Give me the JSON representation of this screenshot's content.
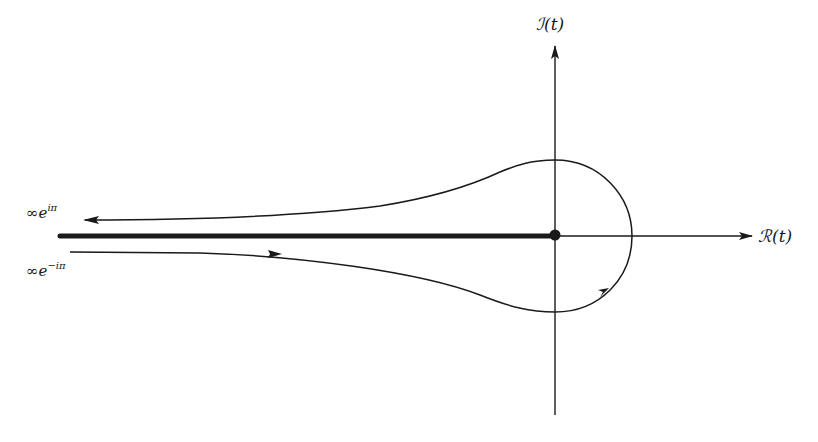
{
  "diagram": {
    "type": "complex-plane contour (Hankel contour)",
    "axes": {
      "vertical_label": "ℐ(t)",
      "horizontal_label": "ℛ(t)"
    },
    "labels": {
      "upper_end": {
        "base": "∞e",
        "exponent": "iπ"
      },
      "lower_end": {
        "base": "∞e",
        "exponent": "−iπ"
      }
    },
    "elements": [
      "vertical imaginary axis with upward arrow",
      "horizontal real axis with rightward arrow",
      "thick branch cut along negative real axis",
      "origin dot",
      "contour from −∞ below cut, around origin counter-clockwise, back to −∞ above cut"
    ],
    "colors": {
      "ink": "#1a1a1a",
      "background": "#ffffff"
    }
  }
}
